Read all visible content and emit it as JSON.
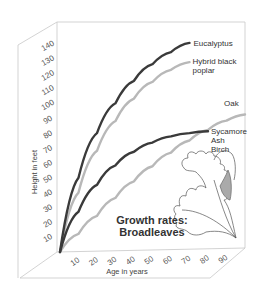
{
  "chart_data": {
    "type": "line",
    "title": "Growth rates: Broadleaves",
    "title_lines": [
      "Growth rates:",
      "Broadleaves"
    ],
    "xlabel": "Age in years",
    "ylabel": "Height in feet",
    "x_ticks": [
      10,
      20,
      30,
      40,
      50,
      60,
      70,
      80,
      90
    ],
    "y_ticks": [
      10,
      20,
      30,
      40,
      50,
      60,
      70,
      80,
      90,
      100,
      110,
      120,
      130,
      140
    ],
    "xlim": [
      0,
      100
    ],
    "ylim": [
      0,
      145
    ],
    "grid": false,
    "legend_position": "inline labels at line ends",
    "series": [
      {
        "name": "Eucalyptus",
        "label_lines": [
          "Eucalyptus"
        ],
        "color": "#3a3a3a",
        "x": [
          0,
          10,
          20,
          30,
          40,
          50,
          60,
          70
        ],
        "y": [
          0,
          50,
          80,
          100,
          115,
          126,
          134,
          140
        ]
      },
      {
        "name": "Hybrid black poplar",
        "label_lines": [
          "Hybrid black",
          "poplar"
        ],
        "color": "#b8b8b8",
        "x": [
          0,
          10,
          20,
          30,
          40,
          50,
          60,
          70
        ],
        "y": [
          0,
          40,
          68,
          88,
          103,
          114,
          122,
          127
        ]
      },
      {
        "name": "Oak",
        "label_lines": [
          "Oak"
        ],
        "color": "#b8b8b8",
        "x": [
          0,
          10,
          20,
          30,
          40,
          50,
          60,
          70,
          80,
          90,
          100
        ],
        "y": [
          0,
          12,
          24,
          36,
          47,
          57,
          66,
          74,
          81,
          87,
          91
        ]
      },
      {
        "name": "Sycamore Ash Birch",
        "label_lines": [
          "Sycamore",
          "Ash",
          "Birch"
        ],
        "color": "#3a3a3a",
        "x": [
          0,
          10,
          20,
          30,
          40,
          50,
          60,
          70,
          80
        ],
        "y": [
          0,
          27,
          45,
          58,
          67,
          73,
          77,
          79,
          80
        ]
      }
    ],
    "decoration": "oak-leaf illustration"
  }
}
